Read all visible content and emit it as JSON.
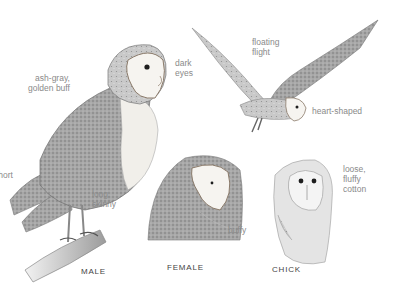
{
  "illustration": {
    "subject": "barn owls",
    "captions": {
      "male": "MALE",
      "female": "FEMALE",
      "chick": "CHICK"
    },
    "annotations": {
      "ash_gray_1": "ash-gray,",
      "ash_gray_2": "golden buff",
      "dark_eyes_1": "dark",
      "dark_eyes_2": "eyes",
      "floating_1": "floating",
      "floating_2": "flight",
      "heart_shaped": "heart-shaped",
      "short": "short",
      "long_skinny_1": "long,",
      "long_skinny_2": "skinny",
      "buffy": "buffy",
      "loose_1": "loose,",
      "loose_2": "fluffy",
      "loose_3": "cotton"
    },
    "colors": {
      "label": "#8a8a8a",
      "caption": "#444444",
      "face": "#f4f1ec",
      "plumage": "#9a9a9a"
    }
  }
}
